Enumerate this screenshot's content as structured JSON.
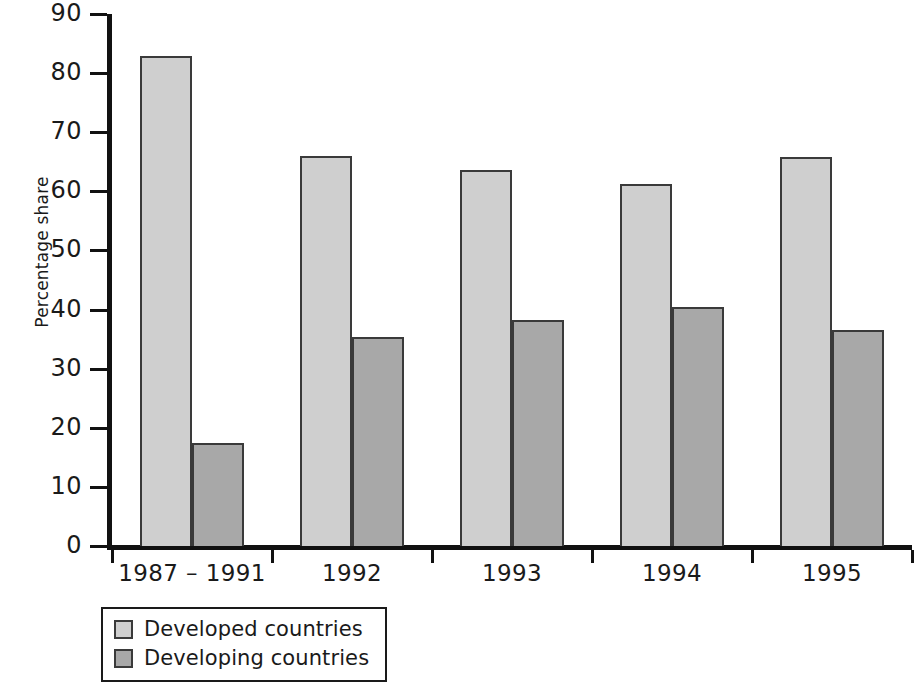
{
  "chart_data": {
    "type": "bar",
    "title": "",
    "subtitle": "",
    "xlabel": "",
    "ylabel": "Percentage share",
    "categories": [
      "1987 – 1991",
      "1992",
      "1993",
      "1994",
      "1995"
    ],
    "series": [
      {
        "name": "Developed countries",
        "color": "#cfcfcf",
        "values": [
          82.9,
          66.0,
          63.6,
          61.2,
          65.8
        ]
      },
      {
        "name": "Developing countries",
        "color": "#a8a8a8",
        "values": [
          17.5,
          35.3,
          38.2,
          40.4,
          36.6
        ]
      }
    ],
    "ylim": [
      0,
      90
    ],
    "yticks": [
      0,
      10,
      20,
      30,
      40,
      50,
      60,
      70,
      80,
      90
    ],
    "ytick_labels": [
      "0",
      "10",
      "20",
      "30",
      "40",
      "50",
      "60",
      "70",
      "80",
      "90"
    ],
    "grid": false,
    "legend_position": "below-axis-left",
    "legend_entries": [
      "Developed countries",
      "Developing countries"
    ],
    "annotations": [],
    "bar_edge_color": "#3a3a3a",
    "axis_color": "#111111"
  }
}
